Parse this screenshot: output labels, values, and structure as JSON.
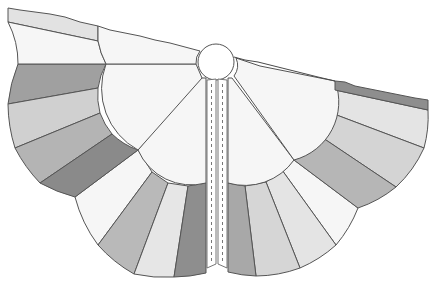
{
  "figure": {
    "type": "garment-pattern-illustration",
    "width": 433,
    "height": 290
  },
  "colors": {
    "background": "#ffffff",
    "outline": "#555555",
    "white": "#f6f6f6",
    "light": "#e6e6e6",
    "lightmid": "#d2d2d2",
    "mid": "#b9b9b9",
    "midDark": "#a6a6a6",
    "dark": "#8e8e8e",
    "stitch": "#777777"
  },
  "neck": {
    "cx": 216,
    "cy": 62,
    "r": 18
  },
  "left_panel": {
    "top_strip": {
      "label": "collar band (light gray)",
      "color": "light"
    },
    "upper_block": {
      "color": "white"
    },
    "inner_scallop": {
      "color": "white"
    },
    "fan_wedges": [
      {
        "name": "wedge-1",
        "color": "dark"
      },
      {
        "name": "wedge-2",
        "color": "lightmid"
      },
      {
        "name": "wedge-3",
        "color": "mid"
      },
      {
        "name": "wedge-4",
        "color": "dark"
      }
    ],
    "lower_fan_wedges": [
      {
        "name": "wedge-5",
        "color": "white"
      },
      {
        "name": "wedge-6",
        "color": "mid"
      },
      {
        "name": "wedge-7",
        "color": "light"
      },
      {
        "name": "wedge-8",
        "color": "dark"
      }
    ]
  },
  "right_panel": {
    "top_strip": {
      "label": "collar band (dark gray)",
      "color": "dark"
    },
    "upper_block": {
      "color": "white"
    },
    "inner_scallop": {
      "color": "white"
    },
    "fan_wedges": [
      {
        "name": "wedge-1",
        "color": "light"
      },
      {
        "name": "wedge-2",
        "color": "lightmid"
      },
      {
        "name": "wedge-3",
        "color": "mid"
      }
    ],
    "lower_fan_wedges": [
      {
        "name": "wedge-4",
        "color": "white"
      },
      {
        "name": "wedge-5",
        "color": "light"
      },
      {
        "name": "wedge-6",
        "color": "lightmid"
      },
      {
        "name": "wedge-7",
        "color": "midDark"
      }
    ]
  },
  "plackets": [
    {
      "side": "left",
      "x": 207,
      "width": 9,
      "stitching": "dashed"
    },
    {
      "side": "right",
      "x": 218,
      "width": 9,
      "stitching": "dashed"
    }
  ]
}
